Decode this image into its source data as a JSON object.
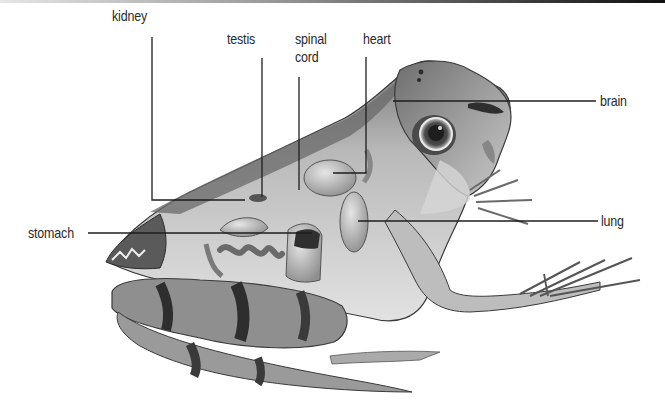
{
  "figure": {
    "style": "grayscale",
    "labels": [
      {
        "id": "kidney",
        "text": "kidney"
      },
      {
        "id": "testis",
        "text": "testis"
      },
      {
        "id": "spinal_cord",
        "text_line1": "spinal",
        "text_line2": "cord"
      },
      {
        "id": "heart",
        "text": "heart"
      },
      {
        "id": "brain",
        "text": "brain"
      },
      {
        "id": "lung",
        "text": "lung"
      },
      {
        "id": "stomach",
        "text": "stomach"
      }
    ]
  },
  "colors": {
    "background": "#ffffff",
    "label_text": "#2a2a2a",
    "leader_line": "#1e1e1e",
    "skin_dark": "#3c3c3c",
    "skin_mid": "#8a8a8a",
    "skin_light": "#c8c8c8",
    "organ": "#a8a8a8"
  }
}
